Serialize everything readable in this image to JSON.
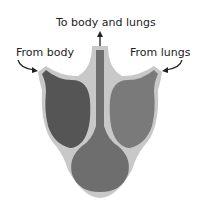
{
  "diagram": {
    "type": "three-chambered heart",
    "labels": {
      "top": "To body and lungs",
      "left": "From body",
      "right": "From lungs"
    },
    "colors": {
      "outer_wall": "#c8c8c8",
      "left_atrium": "#555555",
      "right_atrium": "#7a7a7a",
      "ventricle": "#6e6e6e",
      "vessel": "#7a7a7a",
      "arrow": "#222222"
    }
  }
}
